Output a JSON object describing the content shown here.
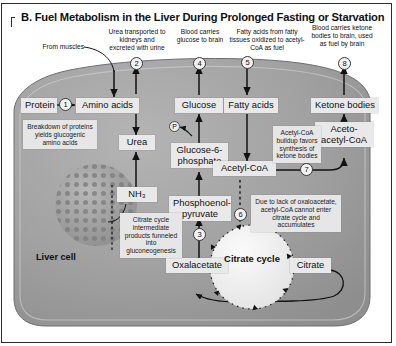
{
  "panel": {
    "title": "B. Fuel Metabolism in the Liver During Prolonged Fasting or Starvation",
    "cell_label": "Liver cell",
    "frame_color": "#2b2b2b",
    "cell_fill": "#9a9a9a",
    "box_fill": "#e9e9e9",
    "note_fill": "#e6e6e6"
  },
  "outside_annotations": [
    {
      "id": "from-muscles",
      "text": "From muscles"
    },
    {
      "id": "urea-transport",
      "text": "Urea transported to kidneys and excreted with urine"
    },
    {
      "id": "glucose-to-brain",
      "text": "Blood carries glucose to brain"
    },
    {
      "id": "fatty-acid-source",
      "text": "Fatty acids from fatty tissues oxidized to acetyl-CoA as fuel"
    },
    {
      "id": "ketone-to-brain",
      "text": "Blood carries ketone bodies to brain, used as fuel by brain"
    }
  ],
  "nodes": [
    {
      "id": "protein",
      "label": "Protein"
    },
    {
      "id": "amino-acids",
      "label": "Amino acids"
    },
    {
      "id": "urea",
      "label": "Urea"
    },
    {
      "id": "glucose",
      "label": "Glucose"
    },
    {
      "id": "fatty-acids",
      "label": "Fatty acids"
    },
    {
      "id": "ketone-bodies",
      "label": "Ketone bodies"
    },
    {
      "id": "glucose-6-phosphate",
      "label": "Glucose-6-phosphate"
    },
    {
      "id": "acetyl-coa",
      "label": "Acetyl-CoA"
    },
    {
      "id": "acetoacetyl-coa",
      "label": "Aceto-acetyl-CoA"
    },
    {
      "id": "ammonia",
      "label": "NH₃"
    },
    {
      "id": "phosphoenolpyruvate",
      "label": "Phosphoenol-pyruvate"
    },
    {
      "id": "oxaloacetate",
      "label": "Oxalacetate"
    },
    {
      "id": "citrate",
      "label": "Citrate"
    }
  ],
  "cycle": {
    "label": "Citrate cycle"
  },
  "phosphate_marker": {
    "label": "P"
  },
  "notes": [
    {
      "id": "note-protein-breakdown",
      "text": "Breakdown of proteins yields glucogenic amino acids"
    },
    {
      "id": "note-citrate-intermediates",
      "text": "Citrate cycle intermediate products funneled into gluconeogenesis"
    },
    {
      "id": "note-acetylcoa-buildup",
      "text": "Acetyl-CoA buildup favors synthesis of ketone bodies"
    },
    {
      "id": "note-oxaloacetate-lack",
      "text": "Due to lack of oxaloacetate, acetyl-CoA cannot enter citrate cycle and accumulates"
    }
  ],
  "markers": [
    {
      "id": "marker-1",
      "label": "1"
    },
    {
      "id": "marker-2",
      "label": "2"
    },
    {
      "id": "marker-3",
      "label": "3"
    },
    {
      "id": "marker-4",
      "label": "4"
    },
    {
      "id": "marker-5",
      "label": "5"
    },
    {
      "id": "marker-6",
      "label": "6"
    },
    {
      "id": "marker-7",
      "label": "7"
    },
    {
      "id": "marker-8",
      "label": "8"
    }
  ]
}
